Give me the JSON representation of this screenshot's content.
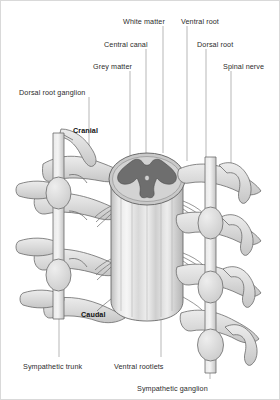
{
  "diagram": {
    "type": "anatomical-illustration",
    "orientation_labels": [
      {
        "name": "cranial",
        "text": "Cranial",
        "x": 72,
        "y": 126,
        "bold": true
      },
      {
        "name": "caudal",
        "text": "Caudal",
        "x": 80,
        "y": 310,
        "bold": true
      }
    ],
    "labels": [
      {
        "name": "dorsal-root-ganglion",
        "text": "Dorsal root ganglion",
        "x": 18,
        "y": 88,
        "leader": {
          "x1": 88,
          "y1": 96,
          "x2": 88,
          "y2": 152
        }
      },
      {
        "name": "grey-matter",
        "text": "Grey matter",
        "x": 92,
        "y": 62,
        "leader": {
          "x1": 129,
          "y1": 70,
          "x2": 129,
          "y2": 168
        }
      },
      {
        "name": "central-canal",
        "text": "Central canal",
        "x": 103,
        "y": 40,
        "leader": {
          "x1": 145,
          "y1": 48,
          "x2": 145,
          "y2": 172
        }
      },
      {
        "name": "white-matter",
        "text": "White matter",
        "x": 122,
        "y": 17,
        "leader": {
          "x1": 162,
          "y1": 25,
          "x2": 162,
          "y2": 152
        }
      },
      {
        "name": "ventral-root",
        "text": "Ventral root",
        "x": 180,
        "y": 17,
        "leader": {
          "x1": 186,
          "y1": 25,
          "x2": 186,
          "y2": 160
        }
      },
      {
        "name": "dorsal-root",
        "text": "Dorsal root",
        "x": 196,
        "y": 40,
        "leader": {
          "x1": 205,
          "y1": 48,
          "x2": 205,
          "y2": 168
        }
      },
      {
        "name": "spinal-nerve",
        "text": "Spinal nerve",
        "x": 222,
        "y": 62,
        "leader": {
          "x1": 230,
          "y1": 70,
          "x2": 230,
          "y2": 186
        }
      },
      {
        "name": "sympathetic-trunk",
        "text": "Sympathetic trunk",
        "x": 22,
        "y": 362,
        "leader": {
          "x1": 58,
          "y1": 318,
          "x2": 58,
          "y2": 356
        }
      },
      {
        "name": "ventral-rootlets",
        "text": "Ventral rootlets",
        "x": 113,
        "y": 362,
        "leader": {
          "x1": 160,
          "y1": 318,
          "x2": 160,
          "y2": 356
        }
      },
      {
        "name": "sympathetic-ganglion",
        "text": "Sympathetic ganglion",
        "x": 136,
        "y": 384,
        "leader": {
          "x1": 209,
          "y1": 348,
          "x2": 209,
          "y2": 378
        }
      }
    ],
    "colors": {
      "grey_matter": "#6e6e6e",
      "white_matter": "#c9c9c9",
      "cord_body_light": "#f2f2f2",
      "cord_body_mid": "#d2d2d2",
      "nerve_fill": "#dcdcdc",
      "ganglion_fill": "#d5d5d5",
      "outline": "#6b6b6b",
      "label_text": "#2b2b2b",
      "leader_line": "#9a9a9a",
      "frame_border": "#d9d9d9"
    }
  }
}
